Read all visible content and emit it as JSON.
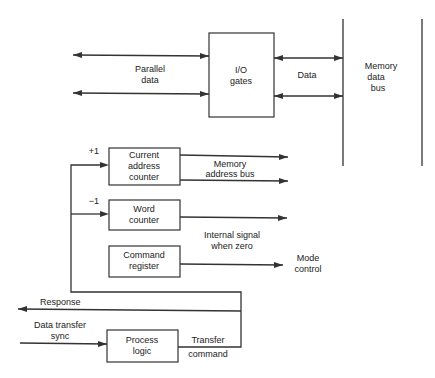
{
  "diagram": {
    "colors": {
      "line": "#333333",
      "text": "#222222",
      "background": "#ffffff"
    },
    "blocks": {
      "io_gates": [
        "I/O",
        "gates"
      ],
      "current_address_counter": [
        "Current",
        "address",
        "counter"
      ],
      "word_counter": [
        "Word",
        "counter"
      ],
      "command_register": [
        "Command",
        "register"
      ],
      "process_logic": [
        "Process",
        "logic"
      ]
    },
    "labels": {
      "parallel_data": [
        "Parallel",
        "data"
      ],
      "data": "Data",
      "memory_data_bus": [
        "Memory",
        "data",
        "bus"
      ],
      "plus_one": "+1",
      "minus_one": "−1",
      "memory_address_bus": [
        "Memory",
        "address bus"
      ],
      "internal_signal": [
        "Internal signal",
        "when zero"
      ],
      "mode_control": [
        "Mode",
        "control"
      ],
      "response": "Response",
      "data_transfer_sync": [
        "Data transfer",
        "sync"
      ],
      "transfer_command": [
        "Transfer",
        "command"
      ]
    }
  }
}
